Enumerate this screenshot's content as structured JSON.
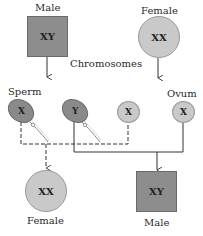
{
  "diagram": {
    "title_center": "Chromosomes",
    "parents": {
      "male": {
        "label": "Male",
        "chromosomes": "XY",
        "shape": "square",
        "color": "#8d8d8d"
      },
      "female": {
        "label": "Female",
        "chromosomes": "XX",
        "shape": "circle",
        "color": "#c9c9c9"
      }
    },
    "gametes": {
      "sperm_label": "Sperm",
      "ovum_label": "Ovum",
      "items": [
        {
          "id": "sperm-x",
          "chromosome": "X",
          "type": "sperm",
          "color": "#8a8a8a"
        },
        {
          "id": "sperm-y",
          "chromosome": "Y",
          "type": "sperm",
          "color": "#8a8a8a"
        },
        {
          "id": "egg-x-1",
          "chromosome": "X",
          "type": "ovum",
          "color": "#c9c9c9"
        },
        {
          "id": "egg-x-2",
          "chromosome": "X",
          "type": "ovum",
          "color": "#c9c9c9"
        }
      ]
    },
    "offspring": {
      "female": {
        "label": "Female",
        "chromosomes": "XX",
        "shape": "circle",
        "line_style": "dashed"
      },
      "male": {
        "label": "Male",
        "chromosomes": "XY",
        "shape": "square",
        "line_style": "solid"
      }
    }
  }
}
